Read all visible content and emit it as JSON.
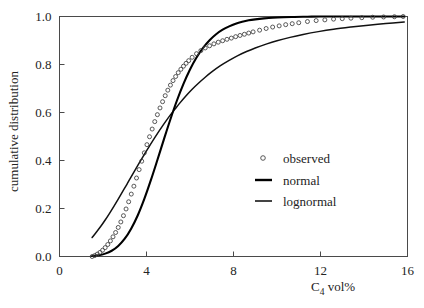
{
  "chart_data": {
    "type": "line",
    "title": "",
    "xlabel": "C4 vol%",
    "xlabel_base": "C",
    "xlabel_sub": "4",
    "xlabel_rest": " vol%",
    "ylabel": "cumulative distribution",
    "xlim": [
      0,
      16
    ],
    "ylim": [
      0.0,
      1.0
    ],
    "xticks": [
      0,
      4,
      8,
      12,
      16
    ],
    "xtick_labels": [
      "0",
      "4",
      "8",
      "12",
      "16"
    ],
    "yticks": [
      0.0,
      0.2,
      0.4,
      0.6,
      0.8,
      1.0
    ],
    "ytick_labels": [
      "0.0",
      "0.2",
      "0.4",
      "0.6",
      "0.8",
      "1.0"
    ],
    "grid": false,
    "legend_position": "center-right",
    "legend": [
      {
        "label": "observed",
        "marker": "open-circle",
        "color": "#3c3c3c"
      },
      {
        "label": "normal",
        "marker": "line-thick",
        "color": "#000000"
      },
      {
        "label": "lognormal",
        "marker": "line-thin",
        "color": "#111111"
      }
    ],
    "series": [
      {
        "name": "observed",
        "type": "scatter",
        "x": [
          1.5,
          1.62,
          1.74,
          1.86,
          1.98,
          2.1,
          2.22,
          2.34,
          2.46,
          2.58,
          2.7,
          2.82,
          2.94,
          3.06,
          3.18,
          3.3,
          3.42,
          3.54,
          3.66,
          3.78,
          3.9,
          4.02,
          4.14,
          4.26,
          4.38,
          4.5,
          4.62,
          4.74,
          4.86,
          4.98,
          5.1,
          5.22,
          5.34,
          5.46,
          5.58,
          5.7,
          5.82,
          5.94,
          6.1,
          6.3,
          6.5,
          6.7,
          6.9,
          7.1,
          7.3,
          7.5,
          7.7,
          7.9,
          8.1,
          8.3,
          8.5,
          8.7,
          8.9,
          9.2,
          9.5,
          9.8,
          10.1,
          10.4,
          10.7,
          11.0,
          11.4,
          11.8,
          12.2,
          12.6,
          13.0,
          13.4,
          13.9,
          14.4,
          14.9,
          15.4,
          15.8
        ],
        "y": [
          0.0,
          0.004,
          0.01,
          0.017,
          0.026,
          0.037,
          0.05,
          0.065,
          0.082,
          0.1,
          0.121,
          0.144,
          0.17,
          0.198,
          0.228,
          0.26,
          0.293,
          0.327,
          0.362,
          0.397,
          0.432,
          0.466,
          0.499,
          0.531,
          0.562,
          0.591,
          0.619,
          0.645,
          0.67,
          0.693,
          0.714,
          0.733,
          0.75,
          0.766,
          0.78,
          0.793,
          0.805,
          0.816,
          0.83,
          0.845,
          0.858,
          0.869,
          0.878,
          0.886,
          0.893,
          0.899,
          0.905,
          0.91,
          0.916,
          0.921,
          0.926,
          0.931,
          0.936,
          0.943,
          0.95,
          0.956,
          0.961,
          0.966,
          0.97,
          0.974,
          0.979,
          0.983,
          0.986,
          0.989,
          0.991,
          0.993,
          0.995,
          0.997,
          0.998,
          0.999,
          1.0
        ]
      },
      {
        "name": "normal",
        "type": "line",
        "x": [
          1.5,
          1.8,
          2.1,
          2.4,
          2.7,
          3.0,
          3.3,
          3.6,
          3.9,
          4.2,
          4.5,
          4.8,
          5.1,
          5.4,
          5.7,
          6.0,
          6.3,
          6.6,
          6.9,
          7.2,
          7.5,
          7.8,
          8.1,
          8.4,
          8.7,
          9.0,
          9.4,
          9.8,
          10.3,
          10.8,
          11.4,
          12.0,
          12.8,
          13.6,
          14.4,
          15.2,
          15.85
        ],
        "y": [
          0.002,
          0.005,
          0.012,
          0.024,
          0.044,
          0.074,
          0.117,
          0.172,
          0.24,
          0.318,
          0.402,
          0.488,
          0.572,
          0.65,
          0.719,
          0.779,
          0.829,
          0.869,
          0.901,
          0.926,
          0.945,
          0.959,
          0.97,
          0.978,
          0.984,
          0.988,
          0.992,
          0.995,
          0.997,
          0.998,
          0.999,
          1.0,
          1.0,
          1.0,
          1.0,
          1.0,
          1.0
        ]
      },
      {
        "name": "lognormal",
        "type": "line",
        "x": [
          1.5,
          1.7,
          1.9,
          2.1,
          2.3,
          2.5,
          2.7,
          2.9,
          3.1,
          3.3,
          3.5,
          3.7,
          3.9,
          4.1,
          4.3,
          4.5,
          4.7,
          4.9,
          5.1,
          5.3,
          5.5,
          5.8,
          6.1,
          6.4,
          6.7,
          7.0,
          7.4,
          7.8,
          8.2,
          8.6,
          9.0,
          9.5,
          10.0,
          10.6,
          11.2,
          11.9,
          12.6,
          13.4,
          14.2,
          15.0,
          15.85
        ],
        "y": [
          0.079,
          0.102,
          0.126,
          0.152,
          0.18,
          0.209,
          0.239,
          0.27,
          0.301,
          0.333,
          0.364,
          0.395,
          0.425,
          0.455,
          0.484,
          0.512,
          0.539,
          0.565,
          0.59,
          0.613,
          0.636,
          0.668,
          0.697,
          0.723,
          0.747,
          0.769,
          0.795,
          0.817,
          0.837,
          0.854,
          0.869,
          0.885,
          0.899,
          0.913,
          0.925,
          0.937,
          0.947,
          0.956,
          0.964,
          0.971,
          0.977
        ]
      }
    ]
  }
}
